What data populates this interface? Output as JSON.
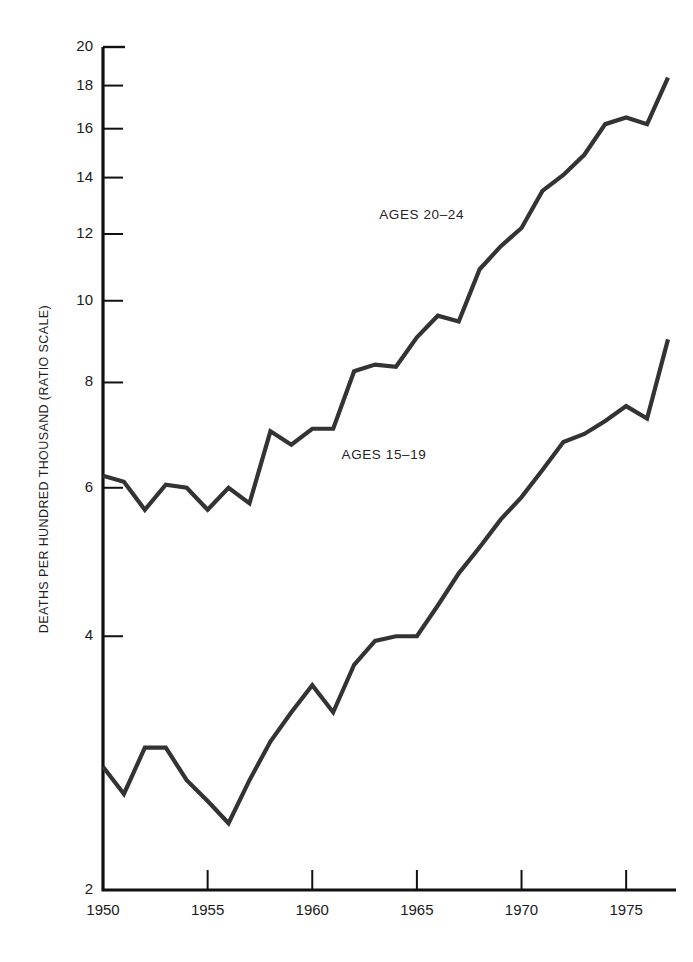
{
  "chart_data": {
    "type": "line",
    "title": "",
    "subtitle": "",
    "xlabel": "",
    "ylabel": "DEATHS PER HUNDRED THOUSAND (RATIO SCALE)",
    "y_scale": "log",
    "ylim": [
      2,
      20
    ],
    "xlim": [
      1950,
      1977
    ],
    "grid": false,
    "legend_position": "inline-annotation",
    "y_ticks": [
      2,
      4,
      6,
      8,
      10,
      12,
      14,
      16,
      18,
      20
    ],
    "y_tick_labels": [
      "2",
      "4",
      "6",
      "8",
      "10",
      "12",
      "14",
      "16",
      "18",
      "20"
    ],
    "x_ticks": [
      1950,
      1955,
      1960,
      1965,
      1970,
      1975
    ],
    "x_tick_labels": [
      "1950",
      "1955",
      "1960",
      "1965",
      "1970",
      "1975"
    ],
    "line_color": "#333333",
    "axis_color": "#111111",
    "x": [
      1950,
      1951,
      1952,
      1953,
      1954,
      1955,
      1956,
      1957,
      1958,
      1959,
      1960,
      1961,
      1962,
      1963,
      1964,
      1965,
      1966,
      1967,
      1968,
      1969,
      1970,
      1971,
      1972,
      1973,
      1974,
      1975,
      1976,
      1977
    ],
    "series": [
      {
        "name": "AGES 20-24",
        "label": "AGES 20–24",
        "label_x": 1963.2,
        "label_y": 12.6,
        "values": [
          6.2,
          6.1,
          5.65,
          6.05,
          6.0,
          5.65,
          6.0,
          5.75,
          7.0,
          6.75,
          7.05,
          7.05,
          8.25,
          8.4,
          8.35,
          9.05,
          9.6,
          9.45,
          10.9,
          11.6,
          12.2,
          13.5,
          14.1,
          14.9,
          16.2,
          16.5,
          16.2,
          18.4
        ]
      },
      {
        "name": "AGES 15-19",
        "label": "AGES 15–19",
        "label_x": 1961.4,
        "label_y": 6.55,
        "values": [
          2.8,
          2.6,
          2.95,
          2.95,
          2.7,
          2.55,
          2.4,
          2.7,
          3.0,
          3.25,
          3.5,
          3.25,
          3.7,
          3.95,
          4.0,
          4.0,
          4.35,
          4.75,
          5.1,
          5.5,
          5.85,
          6.3,
          6.8,
          6.95,
          7.2,
          7.5,
          7.25,
          9.0
        ]
      }
    ]
  }
}
